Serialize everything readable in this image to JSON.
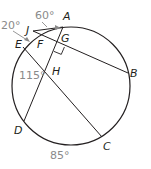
{
  "diagram": {
    "type": "circle-geometry",
    "colors": {
      "line": "#231f20",
      "label": "#231f20",
      "angle_label": "#8a8a8a",
      "background": "#ffffff"
    },
    "circle": {
      "cx": 71,
      "cy": 86,
      "r": 59
    },
    "points": [
      {
        "id": "A",
        "label": "A",
        "x": 63,
        "y": 27,
        "lx": 63,
        "ly": 20
      },
      {
        "id": "B",
        "label": "B",
        "x": 128,
        "y": 73,
        "lx": 130,
        "ly": 77
      },
      {
        "id": "C",
        "label": "C",
        "x": 102,
        "y": 137,
        "lx": 103,
        "ly": 150
      },
      {
        "id": "D",
        "label": "D",
        "x": 24,
        "y": 121,
        "lx": 14,
        "ly": 134
      },
      {
        "id": "E",
        "label": "E",
        "x": 23,
        "y": 47,
        "lx": 15,
        "ly": 48
      },
      {
        "id": "F",
        "label": "F",
        "x": 40,
        "y": 36,
        "lx": 37,
        "ly": 48
      },
      {
        "id": "G",
        "label": "G",
        "x": 57,
        "y": 44,
        "lx": 61,
        "ly": 42
      },
      {
        "id": "H",
        "label": "H",
        "x": 50,
        "y": 73,
        "lx": 52,
        "ly": 75
      },
      {
        "id": "J",
        "label": "J",
        "x": 33,
        "y": 31,
        "lx": 26,
        "ly": 34
      }
    ],
    "segments": [
      {
        "from": "J",
        "to": "B"
      },
      {
        "from": "J",
        "to": "A"
      },
      {
        "from": "A",
        "to": "D"
      },
      {
        "from": "E",
        "to": "C"
      }
    ],
    "angle_labels": [
      {
        "text": "60°",
        "x": 35,
        "y": 19
      },
      {
        "text": "20°",
        "x": 1,
        "y": 29
      },
      {
        "text": "115°",
        "x": 19,
        "y": 79
      },
      {
        "text": "85°",
        "x": 50,
        "y": 159
      }
    ],
    "right_angle_at": "G"
  }
}
